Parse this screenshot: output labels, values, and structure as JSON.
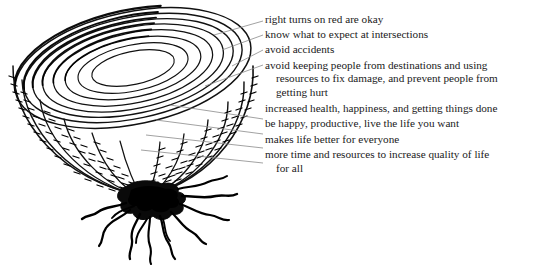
{
  "figure": {
    "type": "onion-layer-diagram",
    "background_color": "#ffffff",
    "ink_color": "#000000",
    "leader_line_color": "#8a8a8a",
    "text_color": "#1a1a1a"
  },
  "diagram": {
    "name": "onion-bulb",
    "layer_count": 8,
    "has_roots": true
  },
  "annotations": [
    {
      "id": "layer-1",
      "lines": [
        "right turns on red are okay"
      ]
    },
    {
      "id": "layer-2",
      "lines": [
        "know what to expect at intersections"
      ]
    },
    {
      "id": "layer-3",
      "lines": [
        "avoid accidents"
      ]
    },
    {
      "id": "layer-4",
      "lines": [
        "avoid keeping people from destinations and using",
        "resources to fix damage, and prevent people from",
        "getting hurt"
      ]
    },
    {
      "id": "layer-5",
      "lines": [
        "increased health, happiness, and getting things done"
      ]
    },
    {
      "id": "layer-6",
      "lines": [
        "be happy, productive, live the life you want"
      ]
    },
    {
      "id": "layer-7",
      "lines": [
        "makes life better for everyone"
      ]
    },
    {
      "id": "layer-8",
      "lines": [
        "more time and resources to increase quality of life",
        "for all"
      ]
    }
  ]
}
